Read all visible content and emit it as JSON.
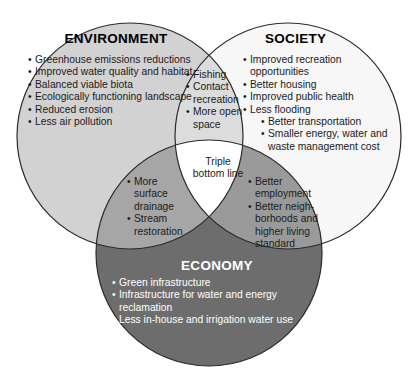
{
  "figure": {
    "type": "venn-diagram-3set",
    "colors": {
      "environment_fill": "#d2d2d2",
      "society_fill": "#f7f7f7",
      "economy_fill": "#6d6d6d",
      "env_soc_fill": "#dcdcdc",
      "env_eco_fill": "#a6a6a6",
      "soc_eco_fill": "#9a9a9a",
      "center_fill": "#ffffff",
      "stroke": "#2b2b2b",
      "text_dark": "#1a1a1a",
      "text_light": "#ffffff"
    }
  },
  "environment": {
    "title": "ENVIRONMENT",
    "items": [
      "Greenhouse emissions reductions",
      "Improved water quality and habitat",
      "Balanced viable biota",
      "Ecologically functioning landscape",
      "Reduced erosion",
      "Less air pollution"
    ]
  },
  "society": {
    "title": "SOCIETY",
    "items": [
      "Improved recreation opportunities",
      "Better housing",
      "Improved public health",
      "Less flooding"
    ],
    "subitems": [
      "Better transportation",
      "Smaller energy, water and waste management cost"
    ]
  },
  "economy": {
    "title": "ECONOMY",
    "items": [
      "Green infrastructure",
      "Infrastructure for water and energy reclamation",
      "Less in-house and irrigation water use"
    ]
  },
  "environment_society": {
    "items": [
      "Fishing",
      "Contact recreation",
      "More open space"
    ]
  },
  "environment_economy": {
    "items": [
      "More surface drainage",
      "Stream restoration"
    ]
  },
  "society_economy": {
    "items": [
      "Better employment",
      "Better neigh-borhoods and higher living standard"
    ]
  },
  "center": {
    "line1": "Triple",
    "line2": "bottom line"
  }
}
